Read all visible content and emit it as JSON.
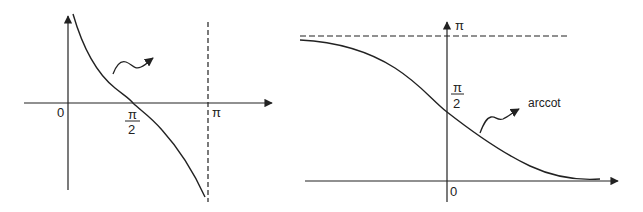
{
  "colors": {
    "ink": "#222222",
    "background": "#ffffff"
  },
  "left_plot": {
    "function": "cot",
    "labels": {
      "origin": "0",
      "half_pi_num": "π",
      "half_pi_den": "2",
      "pi": "π"
    },
    "asymptote": "x = π (dashed vertical)",
    "annotation_arrow": "squiggle-arrow"
  },
  "right_plot": {
    "function": "arccot",
    "labels": {
      "origin": "0",
      "pi": "π",
      "half_pi_num": "π",
      "half_pi_den": "2",
      "curve_name": "arccot"
    },
    "asymptote": "y = π (dashed horizontal)",
    "annotation_arrow": "squiggle-arrow"
  }
}
